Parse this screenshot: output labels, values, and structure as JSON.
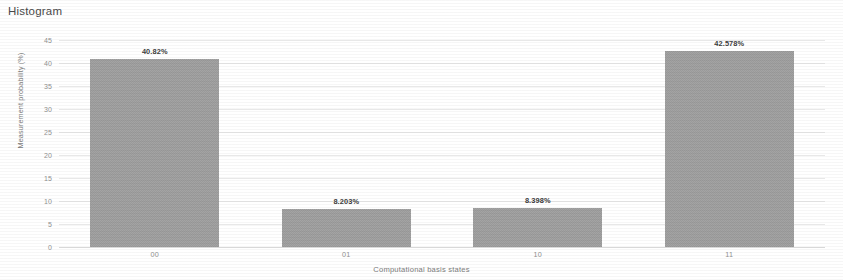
{
  "chart_data": {
    "type": "bar",
    "title": "Histogram",
    "xlabel": "Computational basis states",
    "ylabel": "Measurement probability (%)",
    "categories": [
      "00",
      "01",
      "10",
      "11"
    ],
    "values": [
      40.82,
      8.203,
      8.398,
      42.578
    ],
    "value_labels": [
      "40.82%",
      "8.203%",
      "8.398%",
      "42.578%"
    ],
    "ylim": [
      0,
      45
    ],
    "ytick_labels": [
      "0",
      "5",
      "10",
      "15",
      "20",
      "25",
      "30",
      "35",
      "40",
      "45"
    ],
    "ytick_values": [
      0,
      5,
      10,
      15,
      20,
      25,
      30,
      35,
      40,
      45
    ],
    "grid": true,
    "legend": null,
    "bar_color": "#9a9a9a",
    "grid_color": "#e8e8e8",
    "label_color": "#909090"
  }
}
